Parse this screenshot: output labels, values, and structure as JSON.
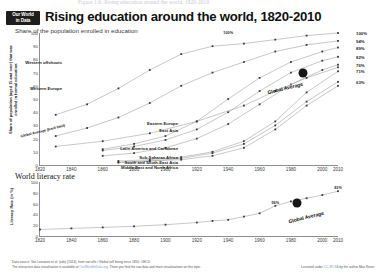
{
  "caption_top": "Figure 1.6: Rising education around the world, 1820-2010",
  "logo": {
    "line1": "Our World",
    "line2": "in Data"
  },
  "header": {
    "title": "Rising education around the world, 1820-2010",
    "subtitle": "Share of the population enrolled in education"
  },
  "footer": {
    "source_line": "Data source: Van Leeuwen et al. (eds) (2014), from van elle / Global self being since 1820, OECD",
    "interactive_line_a": "The interactive data visualisation is available at ",
    "interactive_link": "OurWorldInData.org",
    "interactive_line_b": ". There you find the raw data and more visualizations on this topic.",
    "license_a": "Licensed under ",
    "license_link": "CC-BY-SA",
    "license_b": " by the author Max Roser."
  },
  "chart_data": [
    {
      "type": "line",
      "title": "Share of the population enrolled in education",
      "xlabel": "",
      "ylabel": "Share of population (aged 15 and over) that was enrolled in formal education",
      "xlim": [
        1820,
        2010
      ],
      "ylim": [
        0,
        100
      ],
      "xticks": [
        1820,
        1840,
        1860,
        1880,
        1900,
        1920,
        1940,
        1960,
        1980,
        2000,
        2010
      ],
      "yticks": [
        0,
        10,
        20,
        30,
        40,
        50,
        60,
        70,
        80,
        90,
        100
      ],
      "grid": false,
      "legend_position": "inline-labels",
      "annotations": [
        {
          "text": "100%",
          "x": 1940,
          "y": 98
        },
        {
          "text": "Global Average",
          "x": 1965,
          "y": 62
        }
      ],
      "right_labels": [
        "100%",
        "94%",
        "89%",
        "82%",
        "76%",
        "71%",
        "63%"
      ],
      "series": [
        {
          "name": "Western offshoots",
          "end_label": "100%",
          "x": [
            1830,
            1850,
            1870,
            1890,
            1910,
            1930,
            1950,
            1970,
            1990,
            2010
          ],
          "values": [
            38,
            46,
            58,
            72,
            84,
            90,
            92,
            95,
            98,
            100
          ]
        },
        {
          "name": "Western Europe",
          "end_label": "94%",
          "x": [
            1830,
            1850,
            1870,
            1890,
            1910,
            1930,
            1950,
            1970,
            1990,
            2010
          ],
          "values": [
            22,
            28,
            36,
            47,
            60,
            70,
            78,
            86,
            91,
            94
          ]
        },
        {
          "name": "Eastern Europe",
          "end_label": "89%",
          "x": [
            1860,
            1880,
            1900,
            1920,
            1940,
            1960,
            1980,
            2000,
            2010
          ],
          "values": [
            12,
            16,
            22,
            33,
            50,
            66,
            78,
            86,
            89
          ]
        },
        {
          "name": "East Asia",
          "end_label": "82%",
          "x": [
            1860,
            1880,
            1900,
            1920,
            1940,
            1960,
            1980,
            2000,
            2010
          ],
          "values": [
            11,
            14,
            19,
            27,
            40,
            56,
            70,
            79,
            82
          ]
        },
        {
          "name": "Latin America and Caribbean",
          "end_label": "76%",
          "x": [
            1860,
            1880,
            1900,
            1920,
            1940,
            1960,
            1980,
            2000,
            2010
          ],
          "values": [
            7,
            9,
            13,
            20,
            31,
            46,
            61,
            72,
            76
          ]
        },
        {
          "name": "Sub-Saharan Africa",
          "end_label": "71%",
          "x": [
            1870,
            1890,
            1910,
            1930,
            1950,
            1970,
            1990,
            2010
          ],
          "values": [
            3,
            4,
            6,
            10,
            18,
            33,
            55,
            71
          ]
        },
        {
          "name": "South and South-East Asia",
          "end_label": "63%",
          "x": [
            1870,
            1890,
            1910,
            1930,
            1950,
            1970,
            1990,
            2010
          ],
          "values": [
            2,
            3,
            5,
            9,
            16,
            30,
            48,
            63
          ]
        },
        {
          "name": "Middle East and North Africa",
          "end_label": "",
          "x": [
            1870,
            1890,
            1910,
            1930,
            1950,
            1970,
            1990,
            2010
          ],
          "values": [
            2,
            3,
            4,
            7,
            13,
            27,
            45,
            60
          ]
        },
        {
          "name": "Global Average (hard limit)",
          "end_label": "",
          "x": [
            1830,
            1860,
            1890,
            1920,
            1950,
            1970,
            1990,
            2010
          ],
          "values": [
            14,
            18,
            24,
            33,
            45,
            56,
            66,
            74
          ]
        }
      ]
    },
    {
      "type": "line",
      "title": "World literacy rate",
      "xlabel": "",
      "ylabel": "Literacy Rate (in %)",
      "xlim": [
        1820,
        2010
      ],
      "ylim": [
        0,
        100
      ],
      "xticks": [
        1820,
        1840,
        1860,
        1880,
        1900,
        1920,
        1940,
        1960,
        1980,
        2000,
        2010
      ],
      "yticks": [
        0,
        20,
        40,
        60,
        80,
        100
      ],
      "grid": false,
      "legend_position": "inline-label",
      "annotations": [
        {
          "text": "56%",
          "x": 1970,
          "y": 56
        },
        {
          "text": "83%",
          "x": 2010,
          "y": 83
        },
        {
          "text": "Global Average",
          "x": 1978,
          "y": 44
        }
      ],
      "series": [
        {
          "name": "World literacy rate",
          "x": [
            1820,
            1840,
            1860,
            1880,
            1900,
            1920,
            1930,
            1940,
            1950,
            1960,
            1970,
            1980,
            1990,
            2000,
            2010
          ],
          "values": [
            12,
            14,
            16,
            18,
            21,
            25,
            28,
            30,
            36,
            42,
            56,
            64,
            70,
            76,
            83
          ]
        }
      ]
    }
  ]
}
